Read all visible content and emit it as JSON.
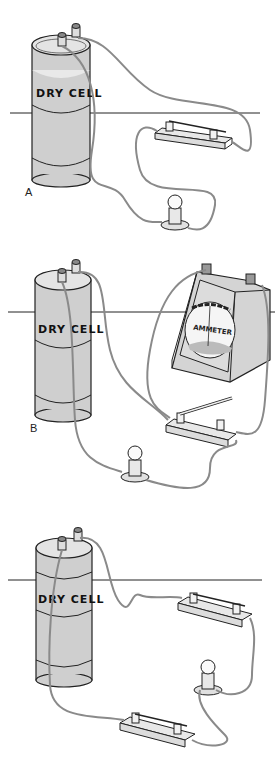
{
  "figure": {
    "panels": [
      {
        "label": "A",
        "cell_label": "DRY CELL",
        "components": [
          "dry-cell",
          "knife-switch",
          "lamp"
        ]
      },
      {
        "label": "B",
        "cell_label": "DRY CELL",
        "meter_label": "AMMETER",
        "components": [
          "dry-cell",
          "ammeter",
          "knife-switch-open",
          "lamp"
        ]
      },
      {
        "label": "",
        "cell_label": "DRY CELL",
        "components": [
          "dry-cell",
          "knife-switch",
          "lamp",
          "knife-switch"
        ]
      }
    ]
  },
  "colors": {
    "cell_body": "#cfcfcf",
    "cell_top": "#e4e4e4",
    "wire": "#8a8a8a",
    "outline": "#222222",
    "background": "#ffffff"
  }
}
